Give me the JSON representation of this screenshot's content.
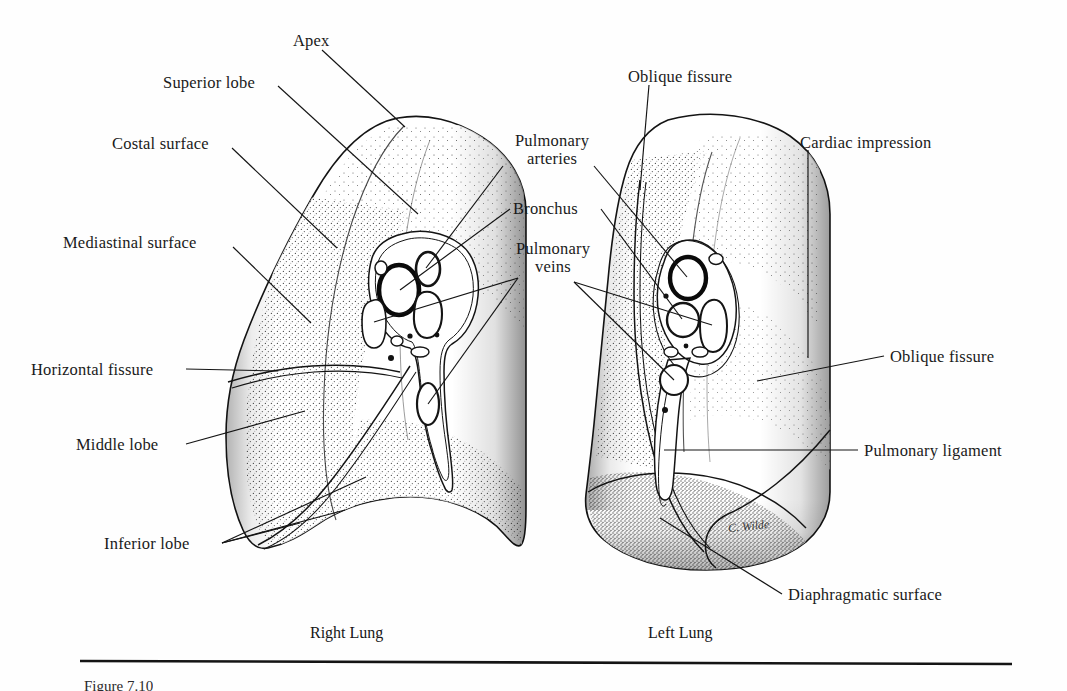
{
  "figure": {
    "title_visible": false,
    "artist_signature": "C. Wilde",
    "caption_clipped": "Figure 7.10",
    "page_background": "#ffffff",
    "ink_color": "#141414"
  },
  "labels": [
    {
      "id": "apex",
      "text": "Apex",
      "x": 293,
      "y": 32,
      "align": "left"
    },
    {
      "id": "superior-lobe",
      "text": "Superior lobe",
      "x": 163,
      "y": 74,
      "align": "left"
    },
    {
      "id": "costal-surface",
      "text": "Costal surface",
      "x": 112,
      "y": 135,
      "align": "left"
    },
    {
      "id": "mediastinal-surface",
      "text": "Mediastinal surface",
      "x": 63,
      "y": 234,
      "align": "left"
    },
    {
      "id": "horizontal-fissure",
      "text": "Horizontal fissure",
      "x": 31,
      "y": 361,
      "align": "left"
    },
    {
      "id": "middle-lobe",
      "text": "Middle lobe",
      "x": 76,
      "y": 440,
      "align": "left"
    },
    {
      "id": "inferior-lobe",
      "text": "Inferior lobe",
      "x": 104,
      "y": 535,
      "align": "left"
    },
    {
      "id": "pulmonary-arteries",
      "text": "Pulmonary\narteries",
      "x": 506,
      "y": 137,
      "align": "left"
    },
    {
      "id": "bronchus",
      "text": "Bronchus",
      "x": 513,
      "y": 201,
      "align": "left"
    },
    {
      "id": "pulmonary-veins",
      "text": "Pulmonary\nveins",
      "x": 511,
      "y": 243,
      "align": "left"
    },
    {
      "id": "oblique-fissure-top",
      "text": "Oblique fissure",
      "x": 628,
      "y": 71,
      "align": "left"
    },
    {
      "id": "cardiac-impression",
      "text": "Cardiac impression",
      "x": 800,
      "y": 137,
      "align": "left"
    },
    {
      "id": "oblique-fissure-right",
      "text": "Oblique fissure",
      "x": 890,
      "y": 352,
      "align": "left"
    },
    {
      "id": "pulmonary-ligament",
      "text": "Pulmonary ligament",
      "x": 864,
      "y": 445,
      "align": "left"
    },
    {
      "id": "diaphragmatic-surface",
      "text": "Diaphragmatic surface",
      "x": 788,
      "y": 591,
      "align": "left"
    }
  ],
  "lung_captions": [
    {
      "id": "right-lung",
      "text": "Right Lung",
      "x": 310,
      "y": 631
    },
    {
      "id": "left-lung",
      "text": "Left Lung",
      "x": 648,
      "y": 631
    }
  ],
  "anatomy": {
    "right_lung": {
      "name": "Right Lung",
      "lobes": [
        "Superior lobe",
        "Middle lobe",
        "Inferior lobe"
      ],
      "fissures": [
        "Horizontal fissure",
        "Oblique fissure"
      ],
      "surfaces": [
        "Costal surface",
        "Mediastinal surface"
      ],
      "hilum_structures": [
        "Pulmonary arteries",
        "Bronchus",
        "Pulmonary veins"
      ]
    },
    "left_lung": {
      "name": "Left Lung",
      "lobes": [
        "Superior lobe",
        "Inferior lobe"
      ],
      "fissures": [
        "Oblique fissure"
      ],
      "surfaces": [
        "Cardiac impression",
        "Diaphragmatic surface"
      ],
      "hilum_structures": [
        "Pulmonary arteries",
        "Bronchus",
        "Pulmonary veins"
      ],
      "other": [
        "Pulmonary ligament"
      ]
    }
  }
}
